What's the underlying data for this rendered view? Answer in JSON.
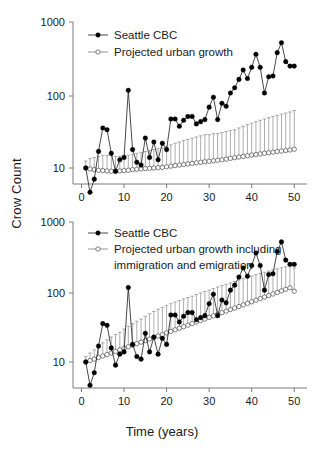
{
  "figure": {
    "y_axis_label": "Crow Count",
    "x_axis_label": "Time (years)"
  },
  "chart_data": [
    {
      "type": "line",
      "panel": "top",
      "title": "",
      "xlabel": "Time (years)",
      "ylabel": "Crow Count",
      "yscale": "log",
      "ylim": [
        3,
        1000
      ],
      "xlim": [
        -2,
        53
      ],
      "yticks": [
        10,
        100,
        1000
      ],
      "ytick_labels": [
        "10",
        "100",
        "1000"
      ],
      "xticks": [
        0,
        10,
        20,
        30,
        40,
        50
      ],
      "xtick_labels": [
        "0",
        "10",
        "20",
        "30",
        "40",
        "50"
      ],
      "grid": false,
      "legend_position": "upper-left",
      "series": [
        {
          "name": "Seattle CBC",
          "marker": "filled-circle",
          "x": [
            1,
            2,
            3,
            4,
            5,
            6,
            7,
            8,
            9,
            10,
            11,
            12,
            13,
            14,
            15,
            16,
            17,
            18,
            19,
            20,
            21,
            22,
            23,
            24,
            25,
            26,
            27,
            28,
            29,
            30,
            31,
            32,
            33,
            34,
            35,
            36,
            37,
            38,
            39,
            40,
            41,
            42,
            43,
            44,
            45,
            46,
            47,
            48,
            49,
            50
          ],
          "values": [
            10,
            4.6,
            7,
            17,
            36,
            34,
            16,
            9,
            13,
            14,
            120,
            18,
            12,
            11,
            26,
            14,
            23,
            13,
            22,
            18,
            48,
            48,
            38,
            46,
            52,
            52,
            41,
            44,
            47,
            70,
            96,
            47,
            79,
            72,
            110,
            130,
            170,
            230,
            175,
            250,
            380,
            250,
            110,
            185,
            190,
            400,
            550,
            300,
            260,
            260
          ]
        },
        {
          "name": "Projected urban growth",
          "marker": "open-circle",
          "error": "upper",
          "x": [
            1,
            2,
            3,
            4,
            5,
            6,
            7,
            8,
            9,
            10,
            11,
            12,
            13,
            14,
            15,
            16,
            17,
            18,
            19,
            20,
            21,
            22,
            23,
            24,
            25,
            26,
            27,
            28,
            29,
            30,
            31,
            32,
            33,
            34,
            35,
            36,
            37,
            38,
            39,
            40,
            41,
            42,
            43,
            44,
            45,
            46,
            47,
            48,
            49,
            50
          ],
          "values": [
            10,
            9.7,
            9.5,
            9.3,
            9.2,
            9.1,
            9.0,
            9.0,
            9.1,
            9.2,
            9.3,
            9.5,
            9.6,
            9.7,
            9.8,
            9.9,
            10,
            10.1,
            10.2,
            10.4,
            10.6,
            10.8,
            11,
            11.2,
            11.4,
            11.6,
            11.8,
            12,
            12.2,
            12.4,
            12.6,
            12.8,
            13,
            13.3,
            13.6,
            13.9,
            14.2,
            14.5,
            14.8,
            15.1,
            15.4,
            15.7,
            16,
            16.3,
            16.6,
            16.9,
            17.2,
            17.5,
            17.8,
            18.2
          ],
          "error_upper": [
            12.5,
            13.5,
            14,
            14.5,
            15,
            15,
            15,
            14.5,
            14.5,
            15,
            15,
            15.5,
            16,
            16.5,
            17,
            17.5,
            18,
            18.5,
            19,
            20,
            21,
            22,
            23,
            24,
            25,
            26,
            27,
            28,
            29,
            29,
            30,
            30,
            31,
            32,
            33,
            34,
            36,
            38,
            40,
            42,
            44,
            46,
            48,
            50,
            52,
            54,
            56,
            58,
            60,
            63
          ]
        }
      ]
    },
    {
      "type": "line",
      "panel": "bottom",
      "title": "",
      "xlabel": "Time (years)",
      "ylabel": "Crow Count",
      "yscale": "log",
      "ylim": [
        3,
        1000
      ],
      "xlim": [
        -2,
        53
      ],
      "yticks": [
        10,
        100,
        1000
      ],
      "ytick_labels": [
        "10",
        "100",
        "1000"
      ],
      "xticks": [
        0,
        10,
        20,
        30,
        40,
        50
      ],
      "xtick_labels": [
        "0",
        "10",
        "20",
        "30",
        "40",
        "50"
      ],
      "grid": false,
      "legend_position": "upper-left",
      "series": [
        {
          "name": "Seattle CBC",
          "marker": "filled-circle",
          "x": [
            1,
            2,
            3,
            4,
            5,
            6,
            7,
            8,
            9,
            10,
            11,
            12,
            13,
            14,
            15,
            16,
            17,
            18,
            19,
            20,
            21,
            22,
            23,
            24,
            25,
            26,
            27,
            28,
            29,
            30,
            31,
            32,
            33,
            34,
            35,
            36,
            37,
            38,
            39,
            40,
            41,
            42,
            43,
            44,
            45,
            46,
            47,
            48,
            49,
            50
          ],
          "values": [
            10,
            4.6,
            7,
            17,
            36,
            34,
            16,
            9,
            13,
            14,
            120,
            18,
            12,
            11,
            26,
            14,
            23,
            13,
            22,
            18,
            48,
            48,
            38,
            46,
            52,
            52,
            41,
            44,
            47,
            70,
            96,
            47,
            79,
            72,
            110,
            130,
            170,
            230,
            175,
            250,
            380,
            250,
            110,
            185,
            190,
            400,
            550,
            300,
            260,
            260
          ]
        },
        {
          "name": "Projected urban growth including immigration and emigration",
          "marker": "open-circle",
          "error": "upper",
          "x": [
            1,
            2,
            3,
            4,
            5,
            6,
            7,
            8,
            9,
            10,
            11,
            12,
            13,
            14,
            15,
            16,
            17,
            18,
            19,
            20,
            21,
            22,
            23,
            24,
            25,
            26,
            27,
            28,
            29,
            30,
            31,
            32,
            33,
            34,
            35,
            36,
            37,
            38,
            39,
            40,
            41,
            42,
            43,
            44,
            45,
            46,
            47,
            48,
            49,
            50
          ],
          "values": [
            10,
            10.5,
            11,
            11.6,
            12.2,
            12.8,
            13.5,
            14.2,
            15,
            15.8,
            16.6,
            17.5,
            18.4,
            19.4,
            20.4,
            21.5,
            22.6,
            23.8,
            25,
            26.4,
            27.8,
            29.3,
            30.8,
            32.5,
            34.2,
            36,
            38,
            40,
            42,
            44.3,
            46.6,
            49.2,
            51.8,
            54.6,
            57.5,
            60.5,
            63.8,
            67.2,
            70.8,
            74.6,
            78.6,
            82.8,
            87.2,
            91.8,
            96.7,
            101.9,
            107.3,
            113,
            119,
            106
          ],
          "error_upper": [
            12,
            13.5,
            15,
            17,
            19,
            21,
            23,
            25,
            27,
            30,
            33,
            36,
            39,
            42,
            46,
            50,
            54,
            58,
            62,
            66,
            70,
            74,
            78,
            82,
            86,
            90,
            95,
            100,
            105,
            110,
            116,
            122,
            128,
            134,
            140,
            147,
            154,
            161,
            168,
            176,
            184,
            192,
            200,
            208,
            216,
            224,
            232,
            240,
            248,
            230
          ]
        }
      ]
    }
  ],
  "legends": {
    "top": [
      {
        "label": "Seattle CBC",
        "marker": "filled-circle"
      },
      {
        "label": "Projected urban growth",
        "marker": "open-circle"
      }
    ],
    "bottom": [
      {
        "label": "Seattle CBC",
        "marker": "filled-circle"
      },
      {
        "label": "Projected urban growth including",
        "marker": "open-circle"
      },
      {
        "label": "immigration and emigration",
        "marker": "none"
      }
    ]
  }
}
